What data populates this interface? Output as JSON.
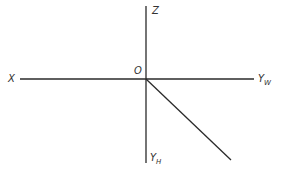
{
  "diagram": {
    "title": "",
    "type": "projection-axes",
    "labels": {
      "z": "Z",
      "origin": "O",
      "x": "X",
      "yw_main": "Y",
      "yw_sub": "W",
      "yh_main": "Y",
      "yh_sub": "H"
    },
    "colors": {
      "line": "#2a2a2a",
      "text": "#333333",
      "background": "#ffffff"
    },
    "geometry": {
      "origin": [
        146,
        79
      ],
      "z_axis_top": [
        146,
        6
      ],
      "yh_axis_bottom": [
        146,
        163
      ],
      "x_axis_left": [
        20,
        79
      ],
      "yw_axis_right": [
        254,
        79
      ],
      "diagonal_end": [
        231,
        160
      ]
    }
  }
}
